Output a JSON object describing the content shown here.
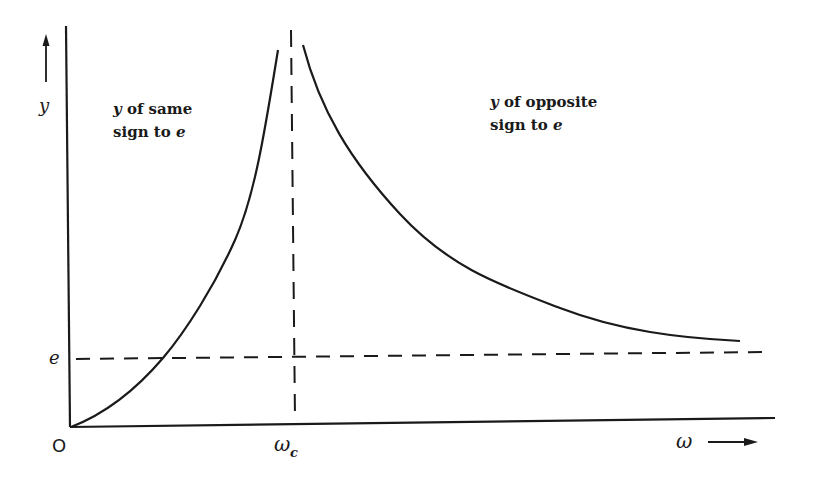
{
  "diagram": {
    "type": "resonance-curve",
    "axes": {
      "y_label": "y",
      "x_label": "ω",
      "origin_label": "O",
      "e_label": "e",
      "critical_label_main": "ω",
      "critical_label_sub": "c"
    },
    "regions": {
      "left": {
        "line1_var": "y",
        "line1_rest": " of same",
        "line2_rest": "sign to ",
        "line2_var": "e"
      },
      "right": {
        "line1_var": "y",
        "line1_rest": " of opposite",
        "line2_rest": "sign to ",
        "line2_var": "e"
      }
    },
    "curves": {
      "below_critical": "rises from origin, crosses e, goes to infinity approaching ω_c",
      "above_critical": "descends from infinity after ω_c, asymptotically approaches e"
    },
    "colors": {
      "ink": "#1a1a1a",
      "background": "#ffffff"
    }
  }
}
